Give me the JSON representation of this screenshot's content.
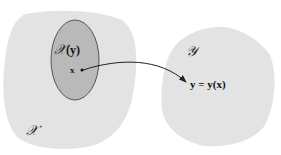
{
  "diagram": {
    "left_set": {
      "label": "𝒳",
      "fill": "#e3e3e3"
    },
    "subset": {
      "label_script": "𝒳",
      "label_arg": "(y)",
      "fill": "#b9b9b9",
      "stroke": "#555555"
    },
    "point": {
      "label": "x"
    },
    "right_set": {
      "label": "𝒴",
      "fill": "#e3e3e3"
    },
    "mapping": {
      "label": "y = y(x)"
    },
    "arrow_color": "#222222"
  }
}
